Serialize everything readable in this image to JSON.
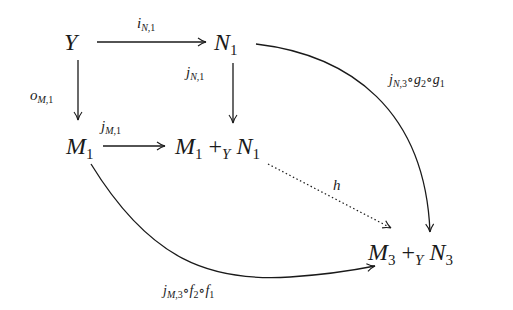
{
  "diagram": {
    "type": "commutative-diagram",
    "nodes": {
      "Y": {
        "base": "Y"
      },
      "N1": {
        "base": "N",
        "sub": "1"
      },
      "M1": {
        "base": "M",
        "sub": "1"
      },
      "pushout1": {
        "left_base": "M",
        "left_sub": "1",
        "op": "+",
        "op_sub": "Y",
        "right_base": "N",
        "right_sub": "1"
      },
      "pushout3": {
        "left_base": "M",
        "left_sub": "3",
        "op": "+",
        "op_sub": "Y",
        "right_base": "N",
        "right_sub": "3"
      }
    },
    "edges": [
      {
        "from": "Y",
        "to": "N1",
        "label": "i_{N,1}",
        "label_base": "i",
        "label_sub_it": "N",
        "label_sub_n": ",1",
        "style": "solid"
      },
      {
        "from": "Y",
        "to": "M1",
        "label": "o_{M,1}",
        "label_base": "o",
        "label_sub_it": "M",
        "label_sub_n": ",1",
        "style": "solid"
      },
      {
        "from": "N1",
        "to": "M1 +_Y N1",
        "label": "j_{N,1}",
        "label_base": "j",
        "label_sub_it": "N",
        "label_sub_n": ",1",
        "style": "solid"
      },
      {
        "from": "M1",
        "to": "M1 +_Y N1",
        "label": "j_{M,1}",
        "label_base": "j",
        "label_sub_it": "M",
        "label_sub_n": ",1",
        "style": "solid"
      },
      {
        "from": "N1",
        "to": "M3 +_Y N3",
        "label": "j_{N,3}∘g_2∘g_1",
        "style": "solid-curved"
      },
      {
        "from": "M1",
        "to": "M3 +_Y N3",
        "label": "j_{M,3}∘f_2∘f_1",
        "style": "solid-curved"
      },
      {
        "from": "M1 +_Y N1",
        "to": "M3 +_Y N3",
        "label": "h",
        "label_base": "h",
        "style": "dotted"
      }
    ],
    "composite_labels": {
      "gN": {
        "j": "j",
        "sub1_it": "N",
        "sub1_n": ",3",
        "c1": "∘",
        "g": "g",
        "g2": "2",
        "c2": "∘",
        "g_b": "g",
        "g1": "1"
      },
      "fM": {
        "j": "j",
        "sub1_it": "M",
        "sub1_n": ",3",
        "c1": "∘",
        "f": "f",
        "f2": "2",
        "c2": "∘",
        "f_b": "f",
        "f1": "1"
      }
    },
    "colors": {
      "ink": "#1a1a1a",
      "background": "#ffffff"
    }
  }
}
